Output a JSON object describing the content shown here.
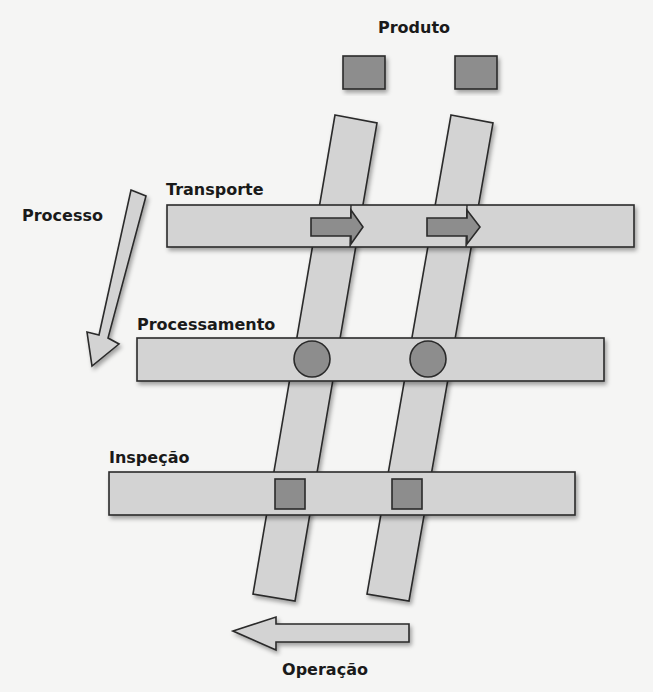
{
  "diagram": {
    "title_top": "Produto",
    "process_label": "Processo",
    "operation_label": "Operação",
    "rows": [
      {
        "label": "Transporte",
        "marker": "arrow"
      },
      {
        "label": "Processamento",
        "marker": "circle"
      },
      {
        "label": "Inspeção",
        "marker": "square"
      }
    ],
    "products_count": 2,
    "colors": {
      "background": "#f5f5f4",
      "fill_light": "#d3d3d3",
      "fill_dark": "#8d8d8d",
      "stroke": "#2a2a2a",
      "text": "#1a1a1a"
    }
  }
}
